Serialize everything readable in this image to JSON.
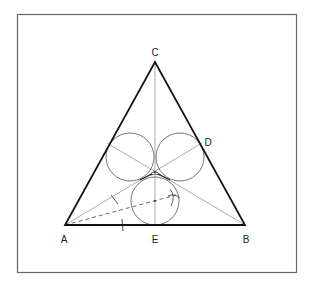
{
  "figure": {
    "frame": {
      "x": 17,
      "y": 14,
      "width": 279,
      "height": 258
    },
    "points": {
      "A": {
        "label": "A",
        "x": 65,
        "y": 225,
        "lx": 64,
        "ly": 242
      },
      "B": {
        "label": "B",
        "x": 245,
        "y": 225,
        "lx": 246,
        "ly": 242
      },
      "C": {
        "label": "C",
        "x": 155,
        "y": 62,
        "lx": 155,
        "ly": 55
      },
      "D": {
        "label": "D",
        "x": 202,
        "y": 143,
        "lx": 208,
        "ly": 145
      },
      "E": {
        "label": "E",
        "x": 155,
        "y": 225,
        "lx": 155,
        "ly": 242
      }
    },
    "labels": [
      "A",
      "B",
      "C",
      "D",
      "E"
    ],
    "circles": [
      {
        "name": "left",
        "cx": 130,
        "cy": 157,
        "r": 24
      },
      {
        "name": "right",
        "cx": 180,
        "cy": 157,
        "r": 24
      },
      {
        "name": "bottom",
        "cx": 155,
        "cy": 201,
        "r": 24
      }
    ],
    "colors": {
      "frame": "#555555",
      "triangle": "#111111",
      "construction": "#666666"
    }
  }
}
